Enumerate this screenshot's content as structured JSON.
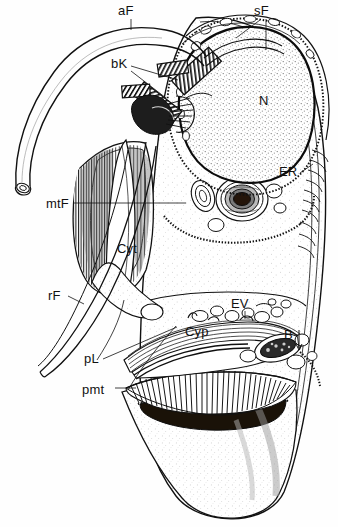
{
  "figure": {
    "kind": "scientific-line-drawing",
    "background_color": "#fefefe",
    "ink_color": "#111111",
    "width_px": 338,
    "height_px": 527
  },
  "labels": [
    {
      "key": "aF",
      "text": "aF",
      "x": 118,
      "y": 15,
      "meaning": "anterior flagellum"
    },
    {
      "key": "sF",
      "text": "sF",
      "x": 254,
      "y": 15,
      "meaning": "secondary flagellum"
    },
    {
      "key": "bK",
      "text": "bK",
      "x": 113,
      "y": 68,
      "meaning": "basal body / kinetosome"
    },
    {
      "key": "N",
      "text": "N",
      "x": 261,
      "y": 103,
      "meaning": "nucleus"
    },
    {
      "key": "ER",
      "text": "ER",
      "x": 281,
      "y": 175,
      "meaning": "endoplasmic reticulum"
    },
    {
      "key": "mtF",
      "text": "mtF",
      "x": 48,
      "y": 204,
      "meaning": "microtubular fibre"
    },
    {
      "key": "Cyt",
      "text": "Cyt",
      "x": 118,
      "y": 251,
      "meaning": "cytoplasm"
    },
    {
      "key": "rF",
      "text": "rF",
      "x": 49,
      "y": 298,
      "meaning": "recurrent flagellum"
    },
    {
      "key": "EV",
      "text": "EV",
      "x": 232,
      "y": 306,
      "meaning": "electron-dense vesicle"
    },
    {
      "key": "Cyp",
      "text": "Cyp",
      "x": 186,
      "y": 334,
      "meaning": "cytopharynx"
    },
    {
      "key": "B",
      "text": "B",
      "x": 285,
      "y": 337,
      "meaning": "basal region / body"
    },
    {
      "key": "pL",
      "text": "pL",
      "x": 85,
      "y": 361,
      "meaning": "peripheral lamella"
    },
    {
      "key": "pmt",
      "text": "pmt",
      "x": 84,
      "y": 392,
      "meaning": "peripheral microtubules"
    }
  ],
  "leader_lines": [
    {
      "label": "aF",
      "path": "M131,19 L131,28"
    },
    {
      "label": "sF",
      "path": "M264,19 L264,48 M258,20 L232,36"
    },
    {
      "label": "bK",
      "path": "M131,66 L176,78 M131,70 L165,96"
    },
    {
      "label": "ER",
      "path": "M299,172 L311,163"
    },
    {
      "label": "mtF",
      "path": "M72,203 L186,203"
    },
    {
      "label": "rF",
      "path": "M66,296 L80,302"
    },
    {
      "label": "EV",
      "path": "M244,310 L244,318"
    },
    {
      "label": "B",
      "path": "M297,333 L299,347"
    },
    {
      "label": "pL",
      "path": "M101,358 L176,327"
    },
    {
      "label": "pmt",
      "path": "M113,388 L133,388"
    }
  ],
  "structures": [
    {
      "name": "anterior-flagellum",
      "description": "long tubular flagellum sweeping from lower-left up and across the top, cut open at its free end"
    },
    {
      "name": "secondary-flagellum",
      "description": "short flagellum at the upper right near the cell apex"
    },
    {
      "name": "basal-bodies",
      "description": "pair of striated cylindrical kinetosomes in the anterior cytoplasm"
    },
    {
      "name": "nucleus",
      "description": "large stippled ovoid body occupying the upper right of the cell"
    },
    {
      "name": "microtubular-fibre",
      "description": "hatched fan of longitudinal fibres in the left mid-body"
    },
    {
      "name": "cytoplasm",
      "description": "lightly stippled ground substance of the cell"
    },
    {
      "name": "recurrent-flagellum",
      "description": "slender tapering flagellum running down the left side"
    },
    {
      "name": "endoplasmic-reticulum",
      "description": "concentric membrane whorl right of the nucleus"
    },
    {
      "name": "electron-dense-vesicles",
      "description": "cluster of small rounded vesicles above the cytopharynx"
    },
    {
      "name": "cytopharynx",
      "description": "curved striated channel across the lower mid-body"
    },
    {
      "name": "peripheral-lamella",
      "description": "thin lamella bordering the posterior chamber"
    },
    {
      "name": "peripheral-microtubules",
      "description": "dense radiating comb of microtubules lining the posterior cup"
    },
    {
      "name": "posterior-cup",
      "description": "large stippled funnel-shaped posterior region with a dark lumen"
    }
  ]
}
